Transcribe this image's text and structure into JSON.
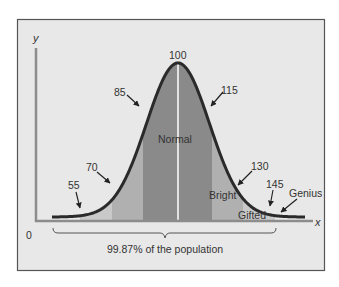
{
  "chart_data": {
    "type": "area",
    "title": "",
    "xlabel": "x",
    "ylabel": "y",
    "origin_label": "0",
    "distribution": "normal",
    "mean": 100,
    "std_dev": 15,
    "x_markers": [
      55,
      70,
      85,
      100,
      115,
      130,
      145
    ],
    "regions": [
      {
        "name": "Normal",
        "from": 85,
        "to": 115,
        "shade": "dark"
      },
      {
        "name": "Bright",
        "from": 115,
        "to": 130,
        "shade": "medium"
      },
      {
        "name": "Gifted",
        "from": 130,
        "to": 145,
        "shade": "light"
      },
      {
        "name": "Genius",
        "from": 145,
        "to": null,
        "shade": "none"
      }
    ],
    "left_bands": [
      {
        "from": 55,
        "to": 70,
        "shade": "light"
      },
      {
        "from": 70,
        "to": 85,
        "shade": "medium"
      }
    ],
    "bracket": {
      "from": 55,
      "to": 145,
      "label": "99.87% of the population"
    },
    "grid": false,
    "legend": null
  },
  "labels": {
    "y_axis": "y",
    "x_axis": "x",
    "origin": "0",
    "m55": "55",
    "m70": "70",
    "m85": "85",
    "m100": "100",
    "m115": "115",
    "m130": "130",
    "m145": "145",
    "normal": "Normal",
    "bright": "Bright",
    "gifted": "Gifted",
    "genius": "Genius",
    "bracket": "99.87% of the population"
  },
  "colors": {
    "frame_bg": "#e8e8e8",
    "frame_border": "#555555",
    "dark_band": "#8a8a8a",
    "medium_band": "#b0b0b0",
    "light_band": "#c9c9c9",
    "curve": "#2a2a2a",
    "axis": "#8c8c8c",
    "mean_line": "#ffffff"
  }
}
